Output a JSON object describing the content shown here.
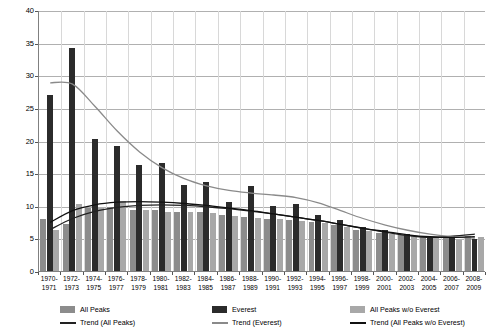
{
  "chart_data": {
    "type": "bar",
    "title": "",
    "xlabel": "",
    "ylabel": "",
    "ylim": [
      0,
      40
    ],
    "ytick_values": [
      0,
      5,
      10,
      15,
      20,
      25,
      30,
      35,
      40
    ],
    "grid": true,
    "legend_position": "bottom",
    "categories": [
      "1970-\n1971",
      "1972-\n1973",
      "1974-\n1975",
      "1976-\n1977",
      "1978-\n1979",
      "1980-\n1981",
      "1982-\n1983",
      "1984-\n1985",
      "1986-\n1987",
      "1988-\n1989",
      "1990-\n1991",
      "1992-\n1993",
      "1994-\n1995",
      "1996-\n1997",
      "1998-\n1999",
      "2000-\n2001",
      "2002-\n2003",
      "2004-\n2005",
      "2006-\n2007",
      "2008-\n2009"
    ],
    "category_lines": [
      [
        "1970-",
        "1971"
      ],
      [
        "1972-",
        "1973"
      ],
      [
        "1974-",
        "1975"
      ],
      [
        "1976-",
        "1977"
      ],
      [
        "1978-",
        "1979"
      ],
      [
        "1980-",
        "1981"
      ],
      [
        "1982-",
        "1983"
      ],
      [
        "1984-",
        "1985"
      ],
      [
        "1986-",
        "1987"
      ],
      [
        "1988-",
        "1989"
      ],
      [
        "1990-",
        "1991"
      ],
      [
        "1992-",
        "1993"
      ],
      [
        "1994-",
        "1995"
      ],
      [
        "1996-",
        "1997"
      ],
      [
        "1998-",
        "1999"
      ],
      [
        "2000-",
        "2001"
      ],
      [
        "2002-",
        "2003"
      ],
      [
        "2004-",
        "2005"
      ],
      [
        "2006-",
        "2007"
      ],
      [
        "2008-",
        "2009"
      ]
    ],
    "series": [
      {
        "name": "All Peaks",
        "kind": "bar",
        "color": "#8c8c8c",
        "values": [
          8.0,
          7.2,
          9.6,
          9.8,
          9.4,
          9.3,
          9.0,
          9.1,
          8.6,
          8.3,
          8.0,
          7.8,
          7.5,
          7.0,
          6.3,
          5.8,
          5.5,
          5.2,
          5.0,
          5.4
        ]
      },
      {
        "name": "Everest",
        "kind": "bar",
        "color": "#2b2b2b",
        "values": [
          27.0,
          34.2,
          20.2,
          19.2,
          16.3,
          16.6,
          13.2,
          13.6,
          10.6,
          13.0,
          10.0,
          10.2,
          8.6,
          7.8,
          6.8,
          6.3,
          5.6,
          5.1,
          5.3,
          4.9
        ]
      },
      {
        "name": "All  Peaks w/o Everest",
        "kind": "bar",
        "color": "#a8a8a8",
        "values": [
          6.3,
          10.2,
          9.7,
          10.8,
          9.3,
          9.0,
          9.0,
          8.9,
          8.5,
          8.2,
          7.9,
          7.6,
          7.3,
          6.8,
          6.1,
          5.6,
          5.3,
          5.0,
          4.8,
          5.2
        ]
      },
      {
        "name": "Trend (All Peaks)",
        "kind": "line",
        "color": "#222222",
        "values": [
          6.5,
          8.2,
          9.3,
          9.9,
          10.2,
          10.3,
          10.2,
          10.0,
          9.7,
          9.3,
          8.9,
          8.4,
          7.9,
          7.3,
          6.7,
          6.1,
          5.6,
          5.3,
          5.5,
          5.8
        ]
      },
      {
        "name": "Trend (Everest)",
        "kind": "line",
        "color": "#8a8a8a",
        "values": [
          29.0,
          28.8,
          25.4,
          21.6,
          18.4,
          16.0,
          14.3,
          13.2,
          12.5,
          12.1,
          11.8,
          11.4,
          10.6,
          9.4,
          8.2,
          7.2,
          6.4,
          5.8,
          5.4,
          5.2
        ]
      },
      {
        "name": "Trend (All Peaks w/o Everest)",
        "kind": "line",
        "color": "#111111",
        "values": [
          7.6,
          9.4,
          10.3,
          10.7,
          10.8,
          10.7,
          10.5,
          10.2,
          9.8,
          9.4,
          8.9,
          8.4,
          7.9,
          7.3,
          6.7,
          6.2,
          5.7,
          5.4,
          5.3,
          5.4
        ]
      }
    ]
  },
  "legend": {
    "entries": [
      {
        "label": "All Peaks",
        "marker": "swatch",
        "color": "#8c8c8c"
      },
      {
        "label": "Trend (All Peaks)",
        "marker": "line",
        "color": "#222222"
      },
      {
        "label": "Everest",
        "marker": "swatch",
        "color": "#2b2b2b"
      },
      {
        "label": "Trend (Everest)",
        "marker": "line",
        "color": "#8a8a8a"
      },
      {
        "label": "All  Peaks w/o Everest",
        "marker": "swatch",
        "color": "#a8a8a8"
      },
      {
        "label": "Trend (All Peaks w/o Everest)",
        "marker": "line",
        "color": "#111111"
      }
    ]
  }
}
